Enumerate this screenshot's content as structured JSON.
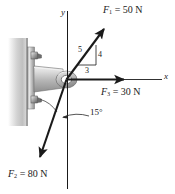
{
  "figure": {
    "colors": {
      "line": "#1a1a1a",
      "wall": "#c9c9c9",
      "bracket_light": "#e2e2e2",
      "bracket_mid": "#b5b5b5",
      "bracket_dark": "#8a8a8a",
      "text": "#1a1a1a"
    },
    "axes": {
      "y_label": "y",
      "x_label": "x"
    },
    "forces": [
      {
        "id": "F1",
        "label_symbol": "F",
        "label_subscript": "1",
        "label_value": "= 50 N",
        "label_text": "F1 = 50 N",
        "magnitude": 50,
        "unit": "N",
        "direction": "up-and-right",
        "slope_ratio": "3-4-5"
      },
      {
        "id": "F2",
        "label_symbol": "F",
        "label_subscript": "2",
        "label_value": "= 80 N",
        "label_text": "F2 = 80 N",
        "magnitude": 80,
        "unit": "N",
        "direction": "down-and-left",
        "angle_from_y_axis_deg": 15
      },
      {
        "id": "F3",
        "label_symbol": "F",
        "label_subscript": "3",
        "label_value": "= 30 N",
        "label_text": "F3 = 30 N",
        "magnitude": 30,
        "unit": "N",
        "direction": "along-positive-x"
      }
    ],
    "slope_triangle": {
      "hypotenuse": "5",
      "vertical": "4",
      "horizontal": "3"
    },
    "angle": {
      "value": "15",
      "degree_symbol": "°",
      "text": "15°"
    }
  }
}
